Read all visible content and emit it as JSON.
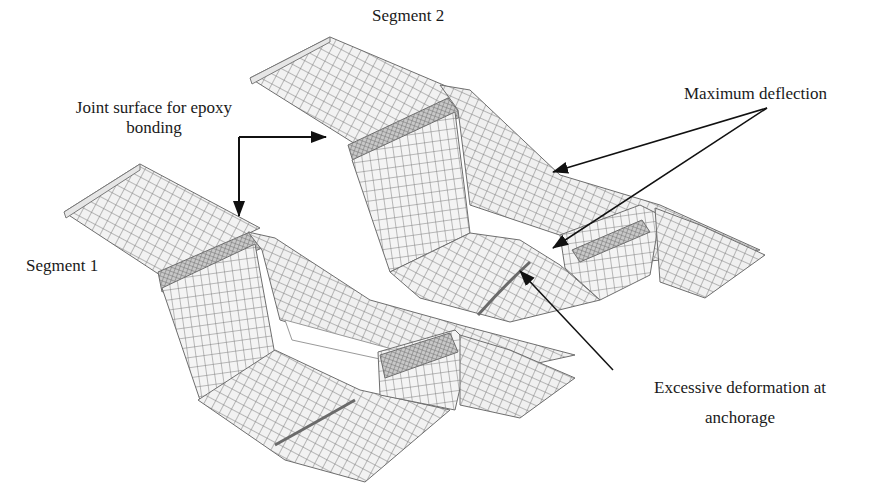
{
  "figure": {
    "background": "#ffffff",
    "mesh_line_color": "#7a7a7a",
    "mesh_fill_color": "#f2f2f2",
    "dense_mesh_color": "#6e6e6e",
    "arrow_color": "#111111",
    "text_color": "#1a1a1a"
  },
  "labels": {
    "segment2": {
      "text": "Segment 2",
      "x": 372,
      "y": 6
    },
    "segment1": {
      "text": "Segment 1",
      "x": 26,
      "y": 256
    },
    "joint_surface": {
      "line1": "Joint surface for epoxy",
      "line2": "bonding",
      "x": 56,
      "y": 98
    },
    "max_deflection": {
      "text": "Maximum deflection",
      "x": 684,
      "y": 84
    },
    "excessive_deformation": {
      "line1": "Excessive deformation at",
      "line2": "anchorage",
      "x": 628,
      "y": 378
    }
  },
  "segments": [
    {
      "name": "Segment 1",
      "role": "lower-left box girder segment"
    },
    {
      "name": "Segment 2",
      "role": "upper-right box girder segment"
    }
  ],
  "annotations": [
    {
      "label": "Joint surface for epoxy bonding",
      "arrow_type": "elbow",
      "targets": [
        "Segment 2 joint face",
        "Segment 1 joint face"
      ]
    },
    {
      "label": "Maximum deflection",
      "arrow_type": "straight",
      "targets": [
        "Segment 2 top flange edge",
        "Segment 2 inner web"
      ]
    },
    {
      "label": "Excessive deformation at anchorage",
      "arrow_type": "straight",
      "targets": [
        "Segment 2 bottom slab anchorage"
      ]
    }
  ]
}
